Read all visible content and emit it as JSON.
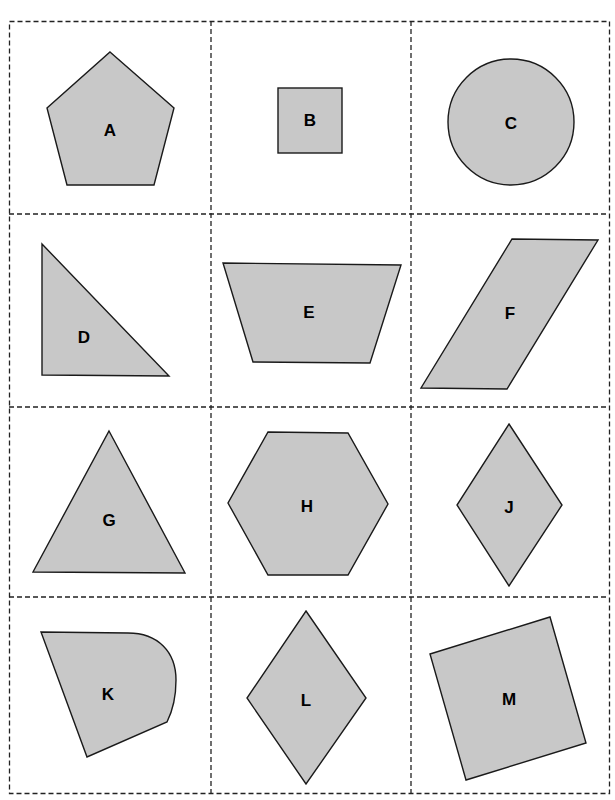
{
  "figure": {
    "colors": {
      "fill": "#c8c8c8",
      "stroke": "#1a1a1a",
      "grid": "#222222",
      "label": "#000000"
    },
    "grid": {
      "columns": 3,
      "rows": 4
    },
    "shapes": [
      {
        "label": "A",
        "type": "pentagon"
      },
      {
        "label": "B",
        "type": "square"
      },
      {
        "label": "C",
        "type": "circle"
      },
      {
        "label": "D",
        "type": "right-triangle"
      },
      {
        "label": "E",
        "type": "trapezoid"
      },
      {
        "label": "F",
        "type": "parallelogram"
      },
      {
        "label": "G",
        "type": "triangle"
      },
      {
        "label": "H",
        "type": "hexagon"
      },
      {
        "label": "J",
        "type": "rhombus"
      },
      {
        "label": "K",
        "type": "curved-quadrilateral"
      },
      {
        "label": "L",
        "type": "rhombus"
      },
      {
        "label": "M",
        "type": "rotated-square"
      }
    ]
  }
}
